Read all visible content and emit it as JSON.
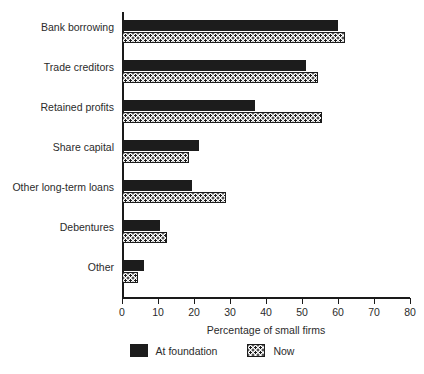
{
  "chart_data": {
    "type": "bar",
    "orientation": "horizontal",
    "title": "",
    "xlabel": "Percentage of small firms",
    "ylabel": "",
    "xlim": [
      0,
      80
    ],
    "xticks": [
      0,
      10,
      20,
      30,
      40,
      50,
      60,
      70,
      80
    ],
    "xtick_labels": [
      "0",
      "10",
      "20",
      "30",
      "40",
      "50",
      "60",
      "70",
      "80"
    ],
    "grid": false,
    "legend_position": "bottom",
    "categories": [
      "Bank borrowing",
      "Trade creditors",
      "Retained profits",
      "Share capital",
      "Other long-term loans",
      "Debentures",
      "Other"
    ],
    "series": [
      {
        "name": "At foundation",
        "color": "#1c1c1c",
        "pattern": "solid",
        "values": [
          60,
          51,
          37,
          21.5,
          19.5,
          10.5,
          6
        ]
      },
      {
        "name": "Now",
        "color": "#ffffff",
        "pattern": "dotted",
        "values": [
          62,
          54.5,
          55.5,
          18.5,
          29,
          12.5,
          4.5
        ]
      }
    ]
  }
}
